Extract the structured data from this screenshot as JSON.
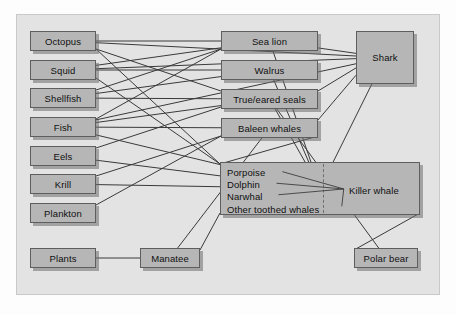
{
  "diagram": {
    "panel": {
      "background": "#e3e3e3",
      "border": "#c9c9c9"
    },
    "node_style": {
      "fill": "#b6b6b6",
      "border": "#5e5e5e",
      "text": "#101010"
    },
    "edge_style": {
      "color": "#3a3a3a",
      "width": 1
    }
  },
  "nodes": {
    "octopus": {
      "label": "Octopus",
      "x": 30,
      "y": 31,
      "w": 66,
      "h": 20
    },
    "squid": {
      "label": "Squid",
      "x": 30,
      "y": 60,
      "w": 66,
      "h": 20
    },
    "shellfish": {
      "label": "Shellfish",
      "x": 30,
      "y": 88,
      "w": 66,
      "h": 20
    },
    "fish": {
      "label": "Fish",
      "x": 30,
      "y": 117,
      "w": 66,
      "h": 20
    },
    "eels": {
      "label": "Eels",
      "x": 30,
      "y": 146,
      "w": 66,
      "h": 20
    },
    "krill": {
      "label": "Krill",
      "x": 30,
      "y": 174,
      "w": 66,
      "h": 20
    },
    "plankton": {
      "label": "Plankton",
      "x": 30,
      "y": 203,
      "w": 66,
      "h": 20
    },
    "plants": {
      "label": "Plants",
      "x": 30,
      "y": 248,
      "w": 66,
      "h": 20
    },
    "sea_lion": {
      "label": "Sea lion",
      "x": 221,
      "y": 31,
      "w": 97,
      "h": 20
    },
    "walrus": {
      "label": "Walrus",
      "x": 221,
      "y": 60,
      "w": 97,
      "h": 20
    },
    "true_eared_seals": {
      "label": "True/eared seals",
      "x": 221,
      "y": 89,
      "w": 97,
      "h": 20
    },
    "baleen_whales": {
      "label": "Baleen whales",
      "x": 221,
      "y": 118,
      "w": 97,
      "h": 20
    },
    "shark": {
      "label": "Shark",
      "x": 356,
      "y": 31,
      "w": 58,
      "h": 53
    },
    "manatee": {
      "label": "Manatee",
      "x": 140,
      "y": 248,
      "w": 60,
      "h": 20
    },
    "polar_bear": {
      "label": "Polar bear",
      "x": 354,
      "y": 248,
      "w": 64,
      "h": 20
    },
    "toothed_whales": {
      "x": 220,
      "y": 162,
      "w": 200,
      "h": 53,
      "list": [
        "Porpoise",
        "Dolphin",
        "Narwhal",
        "Other toothed whales"
      ],
      "right_label": "Killer whale"
    }
  },
  "edges": [
    {
      "from": "octopus",
      "to": "sea_lion"
    },
    {
      "from": "octopus",
      "to": "true_eared_seals"
    },
    {
      "from": "octopus",
      "to": "toothed_whales"
    },
    {
      "from": "octopus",
      "to": "shark"
    },
    {
      "from": "squid",
      "to": "sea_lion"
    },
    {
      "from": "squid",
      "to": "walrus"
    },
    {
      "from": "squid",
      "to": "toothed_whales"
    },
    {
      "from": "squid",
      "to": "shark"
    },
    {
      "from": "shellfish",
      "to": "walrus"
    },
    {
      "from": "shellfish",
      "to": "true_eared_seals"
    },
    {
      "from": "shellfish",
      "to": "sea_lion"
    },
    {
      "from": "fish",
      "to": "sea_lion"
    },
    {
      "from": "fish",
      "to": "true_eared_seals"
    },
    {
      "from": "fish",
      "to": "baleen_whales"
    },
    {
      "from": "fish",
      "to": "toothed_whales"
    },
    {
      "from": "fish",
      "to": "shark"
    },
    {
      "from": "eels",
      "to": "true_eared_seals"
    },
    {
      "from": "eels",
      "to": "toothed_whales"
    },
    {
      "from": "krill",
      "to": "baleen_whales"
    },
    {
      "from": "krill",
      "to": "toothed_whales"
    },
    {
      "from": "plankton",
      "to": "baleen_whales"
    },
    {
      "from": "plants",
      "to": "manatee"
    },
    {
      "from": "manatee",
      "to": "toothed_whales"
    },
    {
      "from": "manatee",
      "to": "baleen_whales"
    },
    {
      "from": "sea_lion",
      "to": "shark"
    },
    {
      "from": "sea_lion",
      "to": "toothed_whales"
    },
    {
      "from": "walrus",
      "to": "toothed_whales"
    },
    {
      "from": "true_eared_seals",
      "to": "shark"
    },
    {
      "from": "true_eared_seals",
      "to": "toothed_whales"
    },
    {
      "from": "baleen_whales",
      "to": "toothed_whales"
    },
    {
      "from": "baleen_whales",
      "to": "shark"
    },
    {
      "from": "shark",
      "to": "toothed_whales"
    },
    {
      "from": "toothed_whales",
      "to": "polar_bear"
    },
    {
      "from": "true_eared_seals",
      "to": "polar_bear"
    }
  ]
}
